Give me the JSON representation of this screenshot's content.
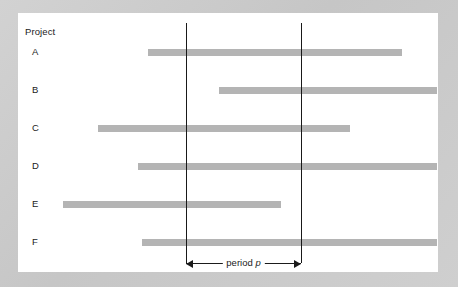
{
  "figure": {
    "panel_background": "#ffffff",
    "surround_background": "#cccccc",
    "bar_color": "#b4b4b4",
    "line_color": "#191919",
    "axis_header": "Project"
  },
  "chart_data": {
    "type": "bar",
    "orientation": "horizontal",
    "title": "",
    "subtitle": "",
    "xlabel": "",
    "ylabel": "Project",
    "categories": [
      "A",
      "B",
      "C",
      "D",
      "E",
      "F"
    ],
    "xlim": [
      0,
      420
    ],
    "grid": false,
    "legend": null,
    "note": "Horizontal timeline (Gantt-style) bars showing each project's duration; two vertical reference lines delimit period p.",
    "bars": [
      {
        "category": "A",
        "start": 130,
        "end": 384,
        "clipped_left": false,
        "clipped_right": false
      },
      {
        "category": "B",
        "start": 201,
        "end": 419,
        "clipped_left": false,
        "clipped_right": true
      },
      {
        "category": "C",
        "start": 80,
        "end": 332,
        "clipped_left": false,
        "clipped_right": false
      },
      {
        "category": "D",
        "start": 120,
        "end": 419,
        "clipped_left": false,
        "clipped_right": true
      },
      {
        "category": "E",
        "start": 45,
        "end": 263,
        "clipped_left": false,
        "clipped_right": false
      },
      {
        "category": "F",
        "start": 124,
        "end": 419,
        "clipped_left": false,
        "clipped_right": true
      }
    ],
    "reference_lines": [
      {
        "name": "period-start",
        "x": 168
      },
      {
        "name": "period-end",
        "x": 283
      }
    ],
    "annotations": [
      {
        "name": "period-span",
        "label_prefix": "period ",
        "label_symbol": "p",
        "from_x": 168,
        "to_x": 283,
        "y": 243,
        "style": "double-headed-arrow"
      }
    ]
  }
}
